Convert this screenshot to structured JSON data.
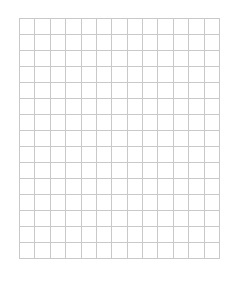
{
  "grid": {
    "columns": 13,
    "rows": 15,
    "x": 19,
    "y": 18,
    "width": 200,
    "height": 240,
    "line_color": "#c9c9c9",
    "background": "#ffffff"
  }
}
